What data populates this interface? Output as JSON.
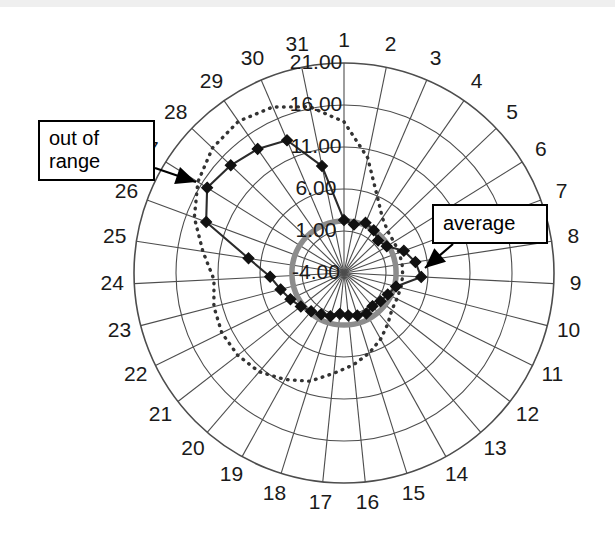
{
  "figure": {
    "type": "polar-radar-chart",
    "background": "#ffffff",
    "scan_band_color": "#e9e9e9"
  },
  "annotations": [
    {
      "name": "out-of-range",
      "label": "out of\nrange",
      "box": {
        "x": 38,
        "y": 120,
        "w": 117,
        "h": 68
      },
      "arrow_from": {
        "x": 155,
        "y": 168
      },
      "arrow_to": {
        "x": 196,
        "y": 182
      }
    },
    {
      "name": "average",
      "label": "average",
      "box": {
        "x": 432,
        "y": 204,
        "w": 116,
        "h": 40
      },
      "arrow_from": {
        "x": 453,
        "y": 244
      },
      "arrow_to": {
        "x": 425,
        "y": 268
      }
    }
  ],
  "colors": {
    "grid": "#4d4d4d",
    "spoke": "#4d4d4d",
    "series_line": "#2b2b2b",
    "series_marker": "#111111",
    "average_circle": "#8c8c8c",
    "out_of_range_dotted": "#333333",
    "label_text": "#1a1a1a",
    "callout_border": "#000000",
    "callout_fill": "#ffffff"
  },
  "chart_data": {
    "type": "line",
    "polar": true,
    "title": "",
    "subtitle": "",
    "xlabel": "",
    "ylabel": "",
    "grid": true,
    "legend_position": "none",
    "center_px": {
      "x": 344,
      "y": 273
    },
    "outer_radius_px": 210,
    "start_angle_deg": -90,
    "direction": "clockwise",
    "categories": [
      "1",
      "2",
      "3",
      "4",
      "5",
      "6",
      "7",
      "8",
      "9",
      "10",
      "11",
      "12",
      "13",
      "14",
      "15",
      "16",
      "17",
      "18",
      "19",
      "20",
      "21",
      "22",
      "23",
      "24",
      "25",
      "26",
      "27",
      "28",
      "29",
      "30",
      "31"
    ],
    "radial_ticks": [
      "-4.00",
      "1.00",
      "6.00",
      "11.00",
      "16.00",
      "21.00"
    ],
    "radial_tick_values": [
      -4,
      1,
      6,
      11,
      16,
      21
    ],
    "rlim": [
      -4,
      21
    ],
    "reference_lines": [
      {
        "name": "average",
        "style": "solid-thick",
        "color": "#8c8c8c",
        "value": 2.2,
        "label": "average"
      },
      {
        "name": "out-of-range-boundary",
        "style": "dotted",
        "color": "#333333",
        "label": "out of range",
        "values": [
          14.0,
          10.0,
          6.0,
          4.0,
          3.2,
          3.0,
          3.0,
          3.0,
          3.0,
          3.0,
          3.0,
          3.2,
          4.0,
          5.0,
          6.0,
          7.0,
          8.0,
          9.5,
          10.5,
          11.5,
          12.0,
          12.2,
          12.0,
          11.5,
          13.0,
          15.0,
          16.5,
          17.6,
          18.0,
          17.5,
          16.2
        ]
      }
    ],
    "series": [
      {
        "name": "observed",
        "color": "#2b2b2b",
        "marker": "diamond",
        "values": [
          2.3,
          1.9,
          2.5,
          2.2,
          1.6,
          2.0,
          3.6,
          4.6,
          5.2,
          2.4,
          1.8,
          1.5,
          1.2,
          1.5,
          1.3,
          1.1,
          0.9,
          1.4,
          1.6,
          2.0,
          2.5,
          3.1,
          3.8,
          4.8,
          7.5,
          13.5,
          15.2,
          14.6,
          14.0,
          13.2,
          9.0
        ]
      }
    ]
  }
}
